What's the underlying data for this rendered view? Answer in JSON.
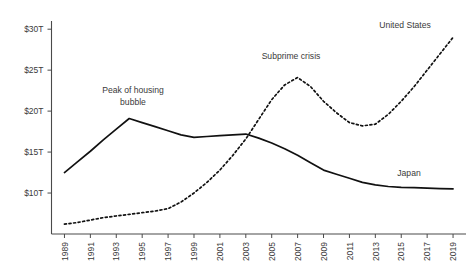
{
  "chart_data": {
    "type": "line",
    "title": "",
    "subtitle": "",
    "xlabel": "",
    "ylabel": "",
    "x": [
      1989,
      1990,
      1991,
      1992,
      1993,
      1994,
      1995,
      1996,
      1997,
      1998,
      1999,
      2000,
      2001,
      2002,
      2003,
      2004,
      2005,
      2006,
      2007,
      2008,
      2009,
      2010,
      2011,
      2012,
      2013,
      2014,
      2015,
      2016,
      2017,
      2018,
      2019
    ],
    "xlim": [
      1988,
      2020
    ],
    "ylim": [
      5,
      31
    ],
    "yticks": [
      10,
      15,
      20,
      25,
      30
    ],
    "ytick_labels": [
      "$10T",
      "$15T",
      "$20T",
      "$25T",
      "$30T"
    ],
    "xticks": [
      1989,
      1991,
      1993,
      1995,
      1997,
      1999,
      2001,
      2003,
      2005,
      2007,
      2009,
      2011,
      2013,
      2015,
      2017,
      2019
    ],
    "xtick_labels": [
      "1989",
      "1991",
      "1993",
      "1995",
      "1997",
      "1999",
      "2001",
      "2003",
      "2005",
      "2007",
      "2009",
      "2011",
      "2013",
      "2015",
      "2017",
      "2019"
    ],
    "grid": false,
    "legend_position": "inline-labels",
    "series": [
      {
        "name": "Japan",
        "style": "solid",
        "color": "#111111",
        "label_text": "Japan",
        "values": [
          12.5,
          13.8,
          15.1,
          16.5,
          17.8,
          19.1,
          18.6,
          18.1,
          17.6,
          17.1,
          16.8,
          16.9,
          17.0,
          17.1,
          17.2,
          16.7,
          16.1,
          15.4,
          14.6,
          13.7,
          12.8,
          12.3,
          11.8,
          11.3,
          11.0,
          10.8,
          10.7,
          10.65,
          10.6,
          10.55,
          10.5
        ]
      },
      {
        "name": "United States",
        "style": "dotted",
        "color": "#111111",
        "label_text": "United States",
        "values": [
          6.2,
          6.4,
          6.7,
          7.0,
          7.2,
          7.4,
          7.6,
          7.8,
          8.1,
          8.9,
          10.0,
          11.3,
          12.8,
          14.6,
          16.6,
          19.0,
          21.4,
          23.2,
          24.1,
          23.0,
          21.2,
          19.8,
          18.6,
          18.2,
          18.4,
          19.6,
          21.2,
          23.0,
          25.0,
          27.0,
          29.0
        ]
      }
    ],
    "annotations": [
      {
        "text": "Peak of housing bubble",
        "line1": "Peak of housing",
        "line2": "bubble",
        "near_year": 1994,
        "near_value": 19.1
      },
      {
        "text": "Subprime crisis",
        "line1": "Subprime crisis",
        "line2": "",
        "near_year": 2006,
        "near_value": 23.2
      }
    ]
  },
  "labels": {
    "us_series_label": "United States",
    "japan_series_label": "Japan",
    "annotation_housing_line1": "Peak of housing",
    "annotation_housing_line2": "bubble",
    "annotation_subprime": "Subprime crisis"
  }
}
